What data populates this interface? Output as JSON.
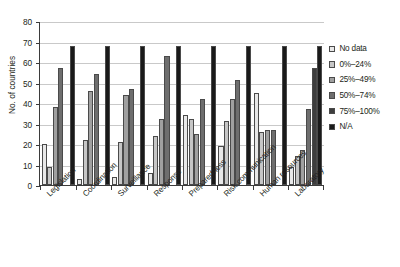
{
  "chart_data": {
    "type": "bar",
    "title": "",
    "xlabel": "",
    "ylabel": "No. of countries",
    "ylim": [
      0,
      80
    ],
    "ytick_step": 10,
    "yticks": [
      0,
      10,
      20,
      30,
      40,
      50,
      60,
      70,
      80
    ],
    "grid": true,
    "legend_position": "right",
    "categories": [
      "Legislation",
      "Coordination",
      "Surveillance",
      "Response",
      "Preparedness",
      "Risk communication",
      "Human resources",
      "Laboratory"
    ],
    "series": [
      {
        "name": "No data",
        "color": "#e8e8e8",
        "values": [
          20,
          3,
          4,
          6,
          34,
          19,
          45,
          9
        ]
      },
      {
        "name": "0%–24%",
        "color": "#c6c6c6",
        "values": [
          9,
          22,
          21,
          24,
          32,
          31,
          26,
          14
        ]
      },
      {
        "name": "25%–49%",
        "color": "#a0a0a0",
        "values": [
          38,
          46,
          44,
          32,
          25,
          42,
          27,
          17
        ]
      },
      {
        "name": "50%–74%",
        "color": "#6e6e6e",
        "values": [
          57,
          54,
          47,
          63,
          42,
          51,
          27,
          37
        ]
      },
      {
        "name": "75%–100%",
        "color": "#3d3d3d",
        "values": [
          0,
          0,
          0,
          0,
          0,
          0,
          0,
          57
        ]
      },
      {
        "name": "N/A",
        "color": "#1a1a1a",
        "values": [
          68,
          68,
          68,
          68,
          68,
          68,
          68,
          68
        ]
      }
    ]
  },
  "legend": {
    "items": [
      {
        "label": "No data",
        "color": "#e8e8e8"
      },
      {
        "label": "0%–24%",
        "color": "#c6c6c6"
      },
      {
        "label": "25%–49%",
        "color": "#a0a0a0"
      },
      {
        "label": "50%–74%",
        "color": "#6e6e6e"
      },
      {
        "label": "75%–100%",
        "color": "#3d3d3d"
      },
      {
        "label": "N/A",
        "color": "#1a1a1a"
      }
    ]
  },
  "axes": {
    "y_title": "No. of countries",
    "y_ticks": [
      "0",
      "10",
      "20",
      "30",
      "40",
      "50",
      "60",
      "70",
      "80"
    ],
    "x_ticks": [
      "Legislation",
      "Coordination",
      "Surveillance",
      "Response",
      "Preparedness",
      "Risk communication",
      "Human resources",
      "Laboratory"
    ]
  }
}
